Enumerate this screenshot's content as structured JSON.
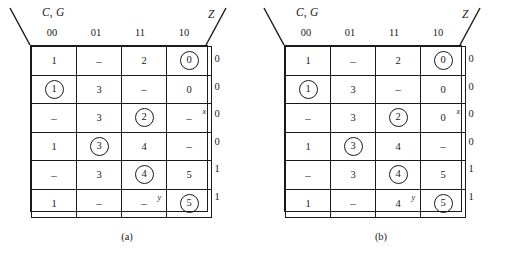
{
  "figure": {
    "maps": [
      {
        "id": "map-a",
        "caption": "(a)",
        "row_label": "C, G",
        "output_label": "Z",
        "column_headers": [
          "00",
          "01",
          "11",
          "10"
        ],
        "rows": [
          {
            "z": "0",
            "cells": [
              {
                "value": "1",
                "circled": false,
                "sup": ""
              },
              {
                "value": "–",
                "circled": false,
                "sup": ""
              },
              {
                "value": "2",
                "circled": false,
                "sup": ""
              },
              {
                "value": "0",
                "circled": true,
                "sup": ""
              }
            ]
          },
          {
            "z": "0",
            "cells": [
              {
                "value": "1",
                "circled": true,
                "sup": ""
              },
              {
                "value": "3",
                "circled": false,
                "sup": ""
              },
              {
                "value": "–",
                "circled": false,
                "sup": ""
              },
              {
                "value": "0",
                "circled": false,
                "sup": ""
              }
            ]
          },
          {
            "z": "0",
            "cells": [
              {
                "value": "–",
                "circled": false,
                "sup": ""
              },
              {
                "value": "3",
                "circled": false,
                "sup": ""
              },
              {
                "value": "2",
                "circled": true,
                "sup": ""
              },
              {
                "value": "–",
                "circled": false,
                "sup": "x"
              }
            ]
          },
          {
            "z": "0",
            "cells": [
              {
                "value": "1",
                "circled": false,
                "sup": ""
              },
              {
                "value": "3",
                "circled": true,
                "sup": ""
              },
              {
                "value": "4",
                "circled": false,
                "sup": ""
              },
              {
                "value": "–",
                "circled": false,
                "sup": ""
              }
            ]
          },
          {
            "z": "1",
            "cells": [
              {
                "value": "–",
                "circled": false,
                "sup": ""
              },
              {
                "value": "3",
                "circled": false,
                "sup": ""
              },
              {
                "value": "4",
                "circled": true,
                "sup": ""
              },
              {
                "value": "5",
                "circled": false,
                "sup": ""
              }
            ]
          },
          {
            "z": "1",
            "cells": [
              {
                "value": "1",
                "circled": false,
                "sup": ""
              },
              {
                "value": "–",
                "circled": false,
                "sup": ""
              },
              {
                "value": "–",
                "circled": false,
                "sup": "y"
              },
              {
                "value": "5",
                "circled": true,
                "sup": ""
              }
            ]
          }
        ]
      },
      {
        "id": "map-b",
        "caption": "(b)",
        "row_label": "C, G",
        "output_label": "Z",
        "column_headers": [
          "00",
          "01",
          "11",
          "10"
        ],
        "rows": [
          {
            "z": "0",
            "cells": [
              {
                "value": "1",
                "circled": false,
                "sup": ""
              },
              {
                "value": "–",
                "circled": false,
                "sup": ""
              },
              {
                "value": "2",
                "circled": false,
                "sup": ""
              },
              {
                "value": "0",
                "circled": true,
                "sup": ""
              }
            ]
          },
          {
            "z": "0",
            "cells": [
              {
                "value": "1",
                "circled": true,
                "sup": ""
              },
              {
                "value": "3",
                "circled": false,
                "sup": ""
              },
              {
                "value": "–",
                "circled": false,
                "sup": ""
              },
              {
                "value": "0",
                "circled": false,
                "sup": ""
              }
            ]
          },
          {
            "z": "0",
            "cells": [
              {
                "value": "–",
                "circled": false,
                "sup": ""
              },
              {
                "value": "3",
                "circled": false,
                "sup": ""
              },
              {
                "value": "2",
                "circled": true,
                "sup": ""
              },
              {
                "value": "0",
                "circled": false,
                "sup": "x"
              }
            ]
          },
          {
            "z": "0",
            "cells": [
              {
                "value": "1",
                "circled": false,
                "sup": ""
              },
              {
                "value": "3",
                "circled": true,
                "sup": ""
              },
              {
                "value": "4",
                "circled": false,
                "sup": ""
              },
              {
                "value": "–",
                "circled": false,
                "sup": ""
              }
            ]
          },
          {
            "z": "1",
            "cells": [
              {
                "value": "–",
                "circled": false,
                "sup": ""
              },
              {
                "value": "3",
                "circled": false,
                "sup": ""
              },
              {
                "value": "4",
                "circled": true,
                "sup": ""
              },
              {
                "value": "5",
                "circled": false,
                "sup": ""
              }
            ]
          },
          {
            "z": "1",
            "cells": [
              {
                "value": "1",
                "circled": false,
                "sup": ""
              },
              {
                "value": "–",
                "circled": false,
                "sup": ""
              },
              {
                "value": "4",
                "circled": false,
                "sup": "y"
              },
              {
                "value": "5",
                "circled": true,
                "sup": ""
              }
            ]
          }
        ]
      }
    ],
    "colors": {
      "ink": "#1a1a1a",
      "background": "#ffffff"
    }
  }
}
